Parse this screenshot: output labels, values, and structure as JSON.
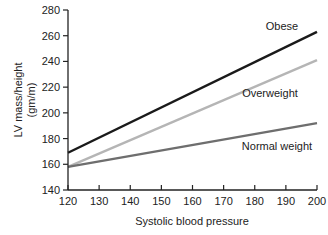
{
  "chart_data": {
    "type": "line",
    "title": "",
    "xlabel": "Systolic blood pressure",
    "ylabel": "LV mass/height (gm/m)",
    "ylabel_lines": [
      "LV mass/height",
      "(gm/m)"
    ],
    "xlim": [
      120,
      200
    ],
    "ylim": [
      140,
      280
    ],
    "xticks": [
      120,
      130,
      140,
      150,
      160,
      170,
      180,
      190,
      200
    ],
    "yticks": [
      140,
      160,
      180,
      200,
      220,
      240,
      260,
      280
    ],
    "grid": false,
    "legend": "inline labels",
    "x": [
      120,
      200
    ],
    "series": [
      {
        "name": "Obese",
        "values": [
          169,
          263
        ],
        "color": "#1a1a1a"
      },
      {
        "name": "Overweight",
        "values": [
          158,
          241
        ],
        "color": "#b5b5b5"
      },
      {
        "name": "Normal weight",
        "values": [
          158,
          192
        ],
        "color": "#6e6e6e"
      }
    ]
  }
}
